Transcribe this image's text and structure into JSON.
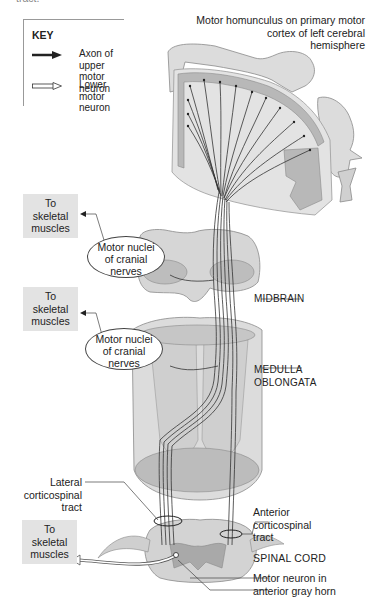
{
  "top_fragment": "tract.",
  "key": {
    "title": "KEY",
    "items": [
      {
        "icon": "solid-arrow-icon",
        "label": "Axon of upper motor neuron"
      },
      {
        "icon": "hollow-arrow-icon",
        "label": "Lower motor neuron"
      }
    ]
  },
  "labels": {
    "homunculus": "Motor homunculus on primary motor cortex of left cerebral hemisphere",
    "homunculus_lines": [
      "Motor homunculus on primary motor",
      "cortex of left cerebral",
      "hemisphere"
    ],
    "midbrain": "MIDBRAIN",
    "medulla_lines": [
      "MEDULLA",
      "OBLONGATA"
    ],
    "lateral_tract_lines": [
      "Lateral",
      "corticospinal",
      "tract"
    ],
    "anterior_tract_lines": [
      "Anterior",
      "corticospinal",
      "tract"
    ],
    "spinal_cord": "SPINAL CORD",
    "motor_neuron_lines": [
      "Motor neuron in",
      "anterior gray horn"
    ]
  },
  "muscle_boxes": [
    {
      "lines": [
        "To",
        "skeletal",
        "muscles"
      ]
    },
    {
      "lines": [
        "To",
        "skeletal",
        "muscles"
      ]
    },
    {
      "lines": [
        "To",
        "skeletal",
        "muscles"
      ]
    }
  ],
  "bubbles": [
    {
      "lines": [
        "Motor nuclei",
        "of cranial",
        "nerves"
      ]
    },
    {
      "lines": [
        "Motor nuclei",
        "of cranial",
        "nerves"
      ]
    }
  ],
  "colors": {
    "tissue_light": "#e6e6e6",
    "tissue_mid": "#c9c9c9",
    "tissue_dark": "#a9a9a9",
    "axon": "#333333",
    "label_box": "#e3e3e3"
  }
}
